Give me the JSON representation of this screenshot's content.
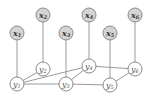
{
  "diagram": {
    "type": "graphical-model",
    "observed_nodes": [
      {
        "id": "x1",
        "base": "x",
        "sub": "1",
        "cx": 17,
        "cy": 33
      },
      {
        "id": "x2",
        "base": "x",
        "sub": "2",
        "cx": 43,
        "cy": 15
      },
      {
        "id": "x3",
        "base": "x",
        "sub": "3",
        "cx": 66,
        "cy": 33
      },
      {
        "id": "x4",
        "base": "x",
        "sub": "4",
        "cx": 89,
        "cy": 15
      },
      {
        "id": "x5",
        "base": "x",
        "sub": "5",
        "cx": 110,
        "cy": 33
      },
      {
        "id": "x6",
        "base": "x",
        "sub": "6",
        "cx": 135,
        "cy": 15
      }
    ],
    "hidden_nodes": [
      {
        "id": "y1",
        "base": "y",
        "sub": "1",
        "cx": 17,
        "cy": 84
      },
      {
        "id": "y2",
        "base": "y",
        "sub": "2",
        "cx": 43,
        "cy": 69
      },
      {
        "id": "y3",
        "base": "y",
        "sub": "3",
        "cx": 66,
        "cy": 84
      },
      {
        "id": "y4",
        "base": "y",
        "sub": "4",
        "cx": 89,
        "cy": 66
      },
      {
        "id": "y5",
        "base": "y",
        "sub": "5",
        "cx": 110,
        "cy": 85
      },
      {
        "id": "y6",
        "base": "y",
        "sub": "6",
        "cx": 135,
        "cy": 69
      }
    ],
    "edges": [
      [
        "x1",
        "y1"
      ],
      [
        "x2",
        "y2"
      ],
      [
        "x3",
        "y3"
      ],
      [
        "x4",
        "y4"
      ],
      [
        "x5",
        "y5"
      ],
      [
        "x6",
        "y6"
      ],
      [
        "y1",
        "y2"
      ],
      [
        "y1",
        "y4"
      ],
      [
        "y1",
        "y3"
      ],
      [
        "y3",
        "y5"
      ],
      [
        "y3",
        "y4"
      ],
      [
        "y4",
        "y6"
      ],
      [
        "y5",
        "y6"
      ]
    ],
    "colors": {
      "observed_fill": "#d4d4d4",
      "hidden_fill": "#ffffff",
      "stroke": "#8a8a8a",
      "edge": "#9a9a9a"
    }
  }
}
